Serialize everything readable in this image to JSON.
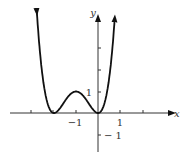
{
  "chart_data": {
    "type": "line",
    "title": "",
    "xlabel": "x",
    "ylabel": "y",
    "function": "y = x^2 (x+2)^2",
    "x": [
      -2.6,
      -2.4,
      -2.2,
      -2.0,
      -1.8,
      -1.6,
      -1.4,
      -1.2,
      -1.0,
      -0.8,
      -0.6,
      -0.4,
      -0.2,
      0.0,
      0.2,
      0.4,
      0.6
    ],
    "series": [
      {
        "name": "f(x)",
        "values": [
          2.43,
          0.92,
          0.19,
          0.0,
          0.13,
          0.41,
          0.71,
          0.92,
          1.0,
          0.92,
          0.71,
          0.41,
          0.13,
          0.0,
          0.19,
          0.92,
          2.43
        ]
      }
    ],
    "tick_labels": {
      "x": [
        "-1",
        "1"
      ],
      "y": [
        "1",
        "-1"
      ]
    },
    "xlim": [
      -3,
      2.5
    ],
    "ylim": [
      -1.5,
      3
    ],
    "grid": false
  },
  "labels": {
    "x_axis": "x",
    "y_axis": "y",
    "x_neg1": "−1",
    "x_pos1": "1",
    "y_pos1": "1",
    "y_neg1": "− 1"
  }
}
